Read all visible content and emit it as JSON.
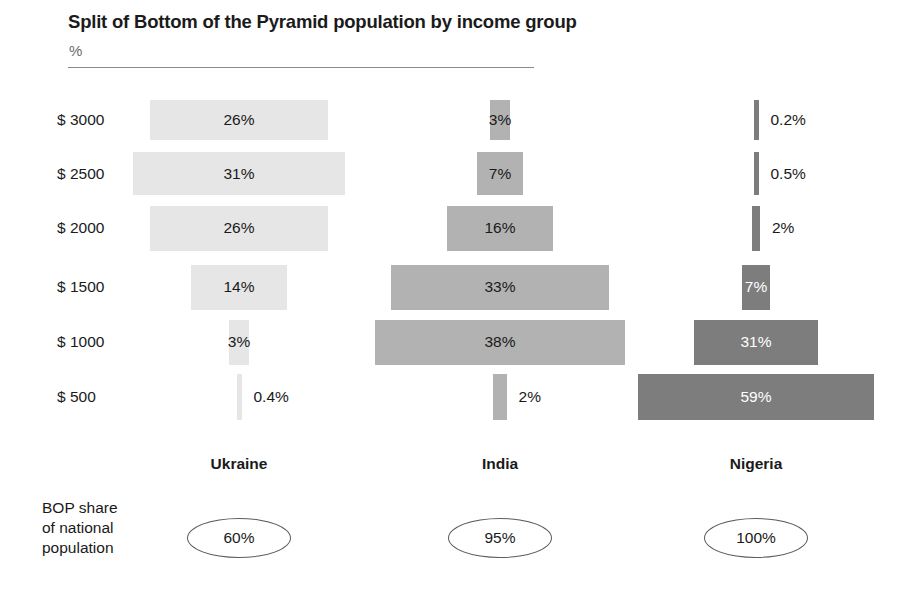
{
  "header": {
    "title": "Split of Bottom of the Pyramid population by income group",
    "unit": "%"
  },
  "footer": {
    "bop_caption_line1": "BOP share",
    "bop_caption_line2": "of national",
    "bop_caption_line3": "population"
  },
  "chart_data": {
    "type": "bar",
    "title": "Split of Bottom of the Pyramid population by income group",
    "subtitle": "%",
    "xlabel": "",
    "ylabel": "",
    "orientation": "horizontal-centered-pyramid",
    "grid": false,
    "legend": "none",
    "categories": [
      "$ 3000",
      "$ 2500",
      "$ 2000",
      "$ 1500",
      "$ 1000",
      "$ 500"
    ],
    "series": [
      {
        "name": "Ukraine",
        "color": "#e6e6e6",
        "bop_share": "60%",
        "values": [
          26,
          31,
          26,
          14,
          3,
          0.4
        ],
        "labels": [
          "26%",
          "31%",
          "26%",
          "14%",
          "3%",
          "0.4%"
        ],
        "label_placement": [
          "inside",
          "inside",
          "inside",
          "inside",
          "inside",
          "outside"
        ]
      },
      {
        "name": "India",
        "color": "#b2b2b2",
        "bop_share": "95%",
        "values": [
          3,
          7,
          16,
          33,
          38,
          2
        ],
        "labels": [
          "3%",
          "7%",
          "16%",
          "33%",
          "38%",
          "2%"
        ],
        "label_placement": [
          "inside",
          "inside",
          "inside",
          "inside",
          "inside",
          "outside"
        ]
      },
      {
        "name": "Nigeria",
        "color": "#7d7d7d",
        "bop_share": "100%",
        "values": [
          0.2,
          0.5,
          2,
          7,
          31,
          59
        ],
        "labels": [
          "0.2%",
          "0.5%",
          "2%",
          "7%",
          "31%",
          "59%"
        ],
        "label_placement": [
          "outside",
          "outside",
          "outside",
          "inside",
          "inside",
          "inside"
        ]
      }
    ],
    "bop_share_label": "BOP share of national population"
  }
}
